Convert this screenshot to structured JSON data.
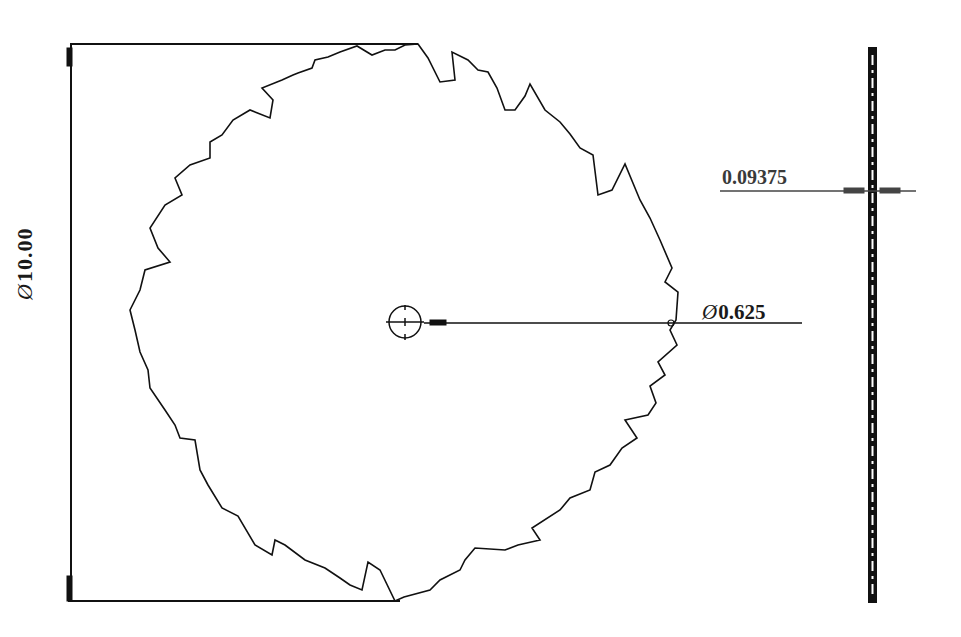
{
  "drawing": {
    "title": "Circular saw blade",
    "colors": {
      "line": "#111111",
      "background": "#ffffff",
      "thickness_text": "#3a3a3a"
    },
    "dimensions": {
      "outer_diameter": {
        "symbol": "Ø",
        "value": "10.00"
      },
      "bore_diameter": {
        "symbol": "Ø",
        "value": "0.625"
      },
      "thickness": {
        "value": "0.09375"
      }
    },
    "views": [
      {
        "name": "front-view",
        "teeth_count_approx": 36
      },
      {
        "name": "side-view"
      }
    ]
  }
}
